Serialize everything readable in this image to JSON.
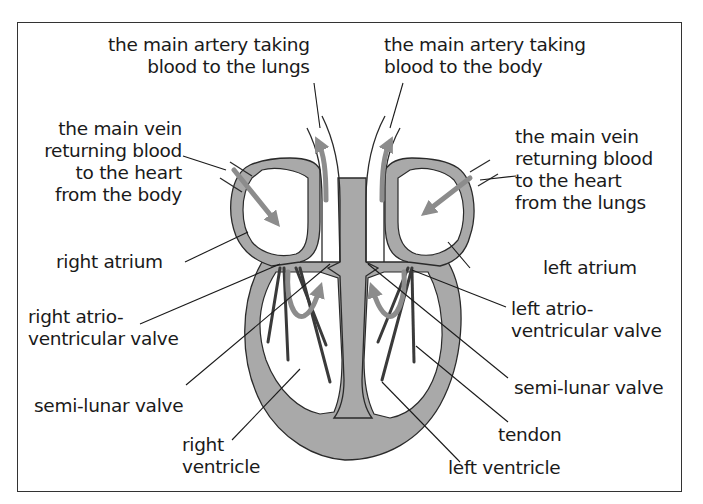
{
  "diagram": {
    "colors": {
      "muscle": "#a9a9a9",
      "outline": "#2a2a2a",
      "arrow": "#8c8c8c",
      "text": "#1a1a1a",
      "border": "#333333"
    },
    "labels": {
      "pulmonary_artery": {
        "line1": "the main artery taking",
        "line2": "blood to the lungs"
      },
      "aorta": {
        "line1": "the main artery taking",
        "line2": "blood to the body"
      },
      "vena_cava": {
        "line1": "the main vein",
        "line2": "returning blood",
        "line3": "to the heart",
        "line4": "from the body"
      },
      "pulmonary_vein": {
        "line1": "the main vein",
        "line2": "returning blood",
        "line3": "to the heart",
        "line4": "from the lungs"
      },
      "right_atrium": "right atrium",
      "left_atrium": "left atrium",
      "right_av_valve": {
        "line1": "right atrio-",
        "line2": "ventricular valve"
      },
      "left_av_valve": {
        "line1": "left atrio-",
        "line2": "ventricular valve"
      },
      "semilunar_left_side": "semi-lunar valve",
      "semilunar_right_side": "semi-lunar valve",
      "right_ventricle": {
        "line1": "right",
        "line2": "ventricle"
      },
      "tendon": "tendon",
      "left_ventricle": "left ventricle"
    }
  }
}
